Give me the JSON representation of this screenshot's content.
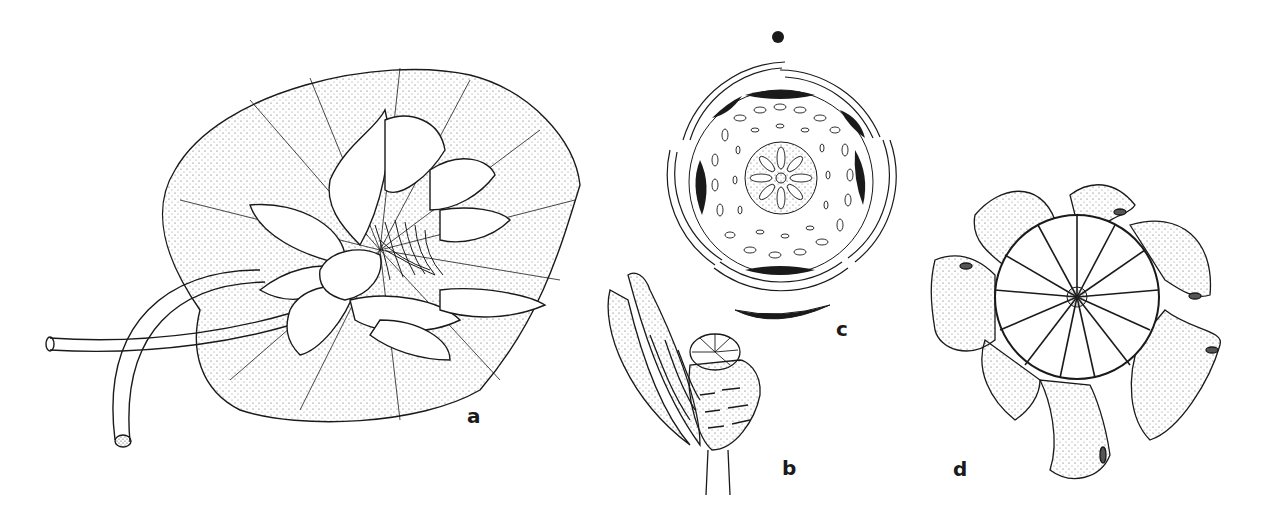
{
  "figure": {
    "panels": [
      {
        "id": "a",
        "label": "a",
        "subject": "water lily leaf with open flower and petioles"
      },
      {
        "id": "b",
        "label": "b",
        "subject": "flower longitudinal section with stamens and ovary"
      },
      {
        "id": "c",
        "label": "c",
        "subject": "floral diagram"
      },
      {
        "id": "d",
        "label": "d",
        "subject": "fruit / stigmatic disc top view"
      }
    ]
  },
  "colors": {
    "ink": "#1a1a1a",
    "paper": "#ffffff",
    "stipple": "#555555"
  }
}
